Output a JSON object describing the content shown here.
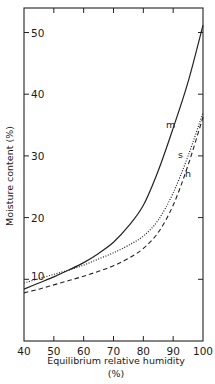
{
  "chart_data": {
    "type": "line",
    "title": "",
    "xlabel": "Equilibrium relative humidity",
    "xlabel_unit": "(%)",
    "ylabel": "Moisture content (%)",
    "xlim": [
      40,
      100
    ],
    "ylim": [
      0,
      55
    ],
    "grid": false,
    "legend_position": "inline labels near curve ends",
    "x_ticks": [
      40,
      50,
      60,
      70,
      80,
      90,
      100
    ],
    "y_ticks": [
      10,
      20,
      30,
      40,
      50
    ],
    "y_tick_labels": [
      "10",
      "20",
      "30",
      "40",
      "50"
    ],
    "x_tick_labels": [
      "40",
      "50",
      "60",
      "70",
      "80",
      "90",
      "100"
    ],
    "series": [
      {
        "name": "m",
        "style": "solid",
        "x": [
          40,
          45,
          50,
          55,
          60,
          65,
          70,
          75,
          80,
          85,
          90,
          95,
          100
        ],
        "values": [
          8.4,
          9.4,
          10.4,
          11.5,
          12.7,
          14.2,
          16.0,
          18.6,
          22.0,
          27.6,
          34.5,
          42.0,
          51.2
        ]
      },
      {
        "name": "s",
        "style": "dotted",
        "x": [
          40,
          45,
          50,
          55,
          60,
          65,
          70,
          75,
          80,
          85,
          90,
          95,
          100
        ],
        "values": [
          9.4,
          10.1,
          10.8,
          11.5,
          12.3,
          13.3,
          14.3,
          15.5,
          17.0,
          19.6,
          24.0,
          30.0,
          37.0
        ]
      },
      {
        "name": "h",
        "style": "dashed",
        "x": [
          40,
          45,
          50,
          55,
          60,
          65,
          70,
          75,
          80,
          85,
          90,
          95,
          100
        ],
        "values": [
          7.8,
          8.4,
          9.1,
          9.8,
          10.5,
          11.3,
          12.2,
          13.4,
          15.0,
          17.6,
          22.0,
          28.5,
          36.3
        ]
      }
    ],
    "annotations": [
      {
        "text": "10",
        "near": "left end of dotted curve at x=40"
      }
    ]
  }
}
